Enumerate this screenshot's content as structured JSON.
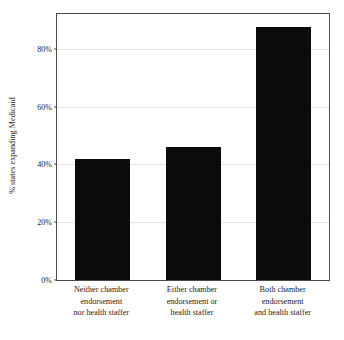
{
  "chart_data": {
    "type": "bar",
    "title": "",
    "xlabel": "",
    "ylabel": "% states expanding Medicaid",
    "categories": [
      "Neither chamber endorsement nor health staffer",
      "Either chamber endorsement or health staffer",
      "Both chamber endorsement and health staffer"
    ],
    "category_lines": [
      [
        "Neither chamber",
        "endorsement",
        "nor health staffer"
      ],
      [
        "Either chamber",
        "endorsement or",
        "health staffer"
      ],
      [
        "Both chamber",
        "endorsement",
        "and health staffer"
      ]
    ],
    "values": [
      42,
      46,
      87.5
    ],
    "ylim": [
      0,
      92
    ],
    "yticks": [
      0,
      20,
      40,
      60,
      80
    ],
    "ytick_labels": [
      "0%",
      "20%",
      "40%",
      "60%",
      "80%"
    ],
    "grid": true,
    "legend": "none",
    "bar_color": "#0b0b0b",
    "grid_color": "#e3e3e3",
    "axis_color": "#4a4a4a"
  }
}
